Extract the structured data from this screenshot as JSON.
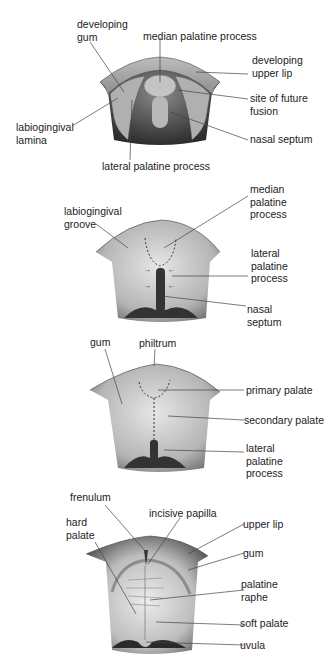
{
  "panels": [
    {
      "id": "stage-1",
      "labels": {
        "developing_gum": "developing\ngum",
        "median_palatine_process": "median palatine process",
        "developing_upper_lip": "developing\nupper lip",
        "site_of_future_fusion": "site of future\nfusion",
        "labiogingival_lamina": "labiogingival\nlamina",
        "nasal_septum": "nasal septum",
        "lateral_palatine_process": "lateral palatine process"
      }
    },
    {
      "id": "stage-2",
      "labels": {
        "labiogingival_groove": "labiogingival\ngroove",
        "median_palatine_process": "median\npalatine\nprocess",
        "lateral_palatine_process": "lateral\npalatine\nprocess",
        "nasal_septum": "nasal\nseptum"
      }
    },
    {
      "id": "stage-3",
      "labels": {
        "gum": "gum",
        "philtrum": "philtrum",
        "primary_palate": "primary palate",
        "secondary_palate": "secondary palate",
        "lateral_palatine_process": "lateral\npalatine\nprocess"
      }
    },
    {
      "id": "stage-4",
      "labels": {
        "frenulum": "frenulum",
        "incisive_papilla": "incisive papilla",
        "hard_palate": "hard\npalate",
        "upper_lip": "upper lip",
        "gum": "gum",
        "palatine_raphe": "palatine\nraphe",
        "soft_palate": "soft palate",
        "uvula": "uvula"
      }
    }
  ],
  "colors": {
    "ink": "#222222",
    "tissue_light": "#d9d9d9",
    "tissue_mid": "#a8a8a8",
    "tissue_dark": "#3a3a3a",
    "leader": "#444444"
  }
}
